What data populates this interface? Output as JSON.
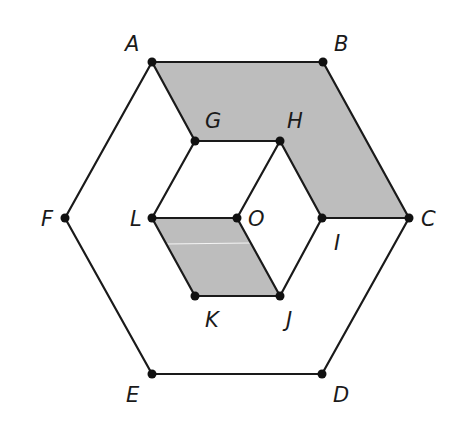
{
  "diagram": {
    "type": "nested regular hexagons with shaded regions",
    "colors": {
      "line": "#1a1a1a",
      "point": "#111111",
      "shade": "#bdbdbd",
      "background": "#ffffff"
    },
    "points": {
      "A": {
        "x": 152,
        "y": 62
      },
      "B": {
        "x": 323,
        "y": 62
      },
      "C": {
        "x": 409,
        "y": 218
      },
      "D": {
        "x": 322,
        "y": 374
      },
      "E": {
        "x": 152,
        "y": 374
      },
      "F": {
        "x": 65,
        "y": 218
      },
      "G": {
        "x": 195,
        "y": 141
      },
      "H": {
        "x": 280,
        "y": 141
      },
      "I": {
        "x": 322,
        "y": 218
      },
      "J": {
        "x": 280,
        "y": 296
      },
      "K": {
        "x": 195,
        "y": 296
      },
      "L": {
        "x": 152,
        "y": 218
      },
      "O": {
        "x": 237,
        "y": 218
      }
    },
    "labels": {
      "A": "A",
      "B": "B",
      "C": "C",
      "D": "D",
      "E": "E",
      "F": "F",
      "G": "G",
      "H": "H",
      "I": "I",
      "J": "J",
      "K": "K",
      "L": "L",
      "O": "O"
    },
    "outer_hexagon": [
      "A",
      "B",
      "C",
      "D",
      "E",
      "F"
    ],
    "inner_hexagon": [
      "G",
      "H",
      "I",
      "J",
      "K",
      "L"
    ],
    "segments": [
      [
        "A",
        "B"
      ],
      [
        "B",
        "C"
      ],
      [
        "C",
        "D"
      ],
      [
        "D",
        "E"
      ],
      [
        "E",
        "F"
      ],
      [
        "F",
        "A"
      ],
      [
        "G",
        "H"
      ],
      [
        "H",
        "I"
      ],
      [
        "I",
        "J"
      ],
      [
        "J",
        "K"
      ],
      [
        "K",
        "L"
      ],
      [
        "L",
        "G"
      ],
      [
        "A",
        "G"
      ],
      [
        "I",
        "C"
      ],
      [
        "L",
        "O"
      ],
      [
        "O",
        "H"
      ],
      [
        "O",
        "J"
      ]
    ],
    "shaded_regions": [
      {
        "name": "ABCIHG",
        "vertices": [
          "A",
          "B",
          "C",
          "I",
          "H",
          "G"
        ]
      },
      {
        "name": "LOJK",
        "vertices": [
          "L",
          "O",
          "J",
          "K"
        ]
      }
    ]
  }
}
